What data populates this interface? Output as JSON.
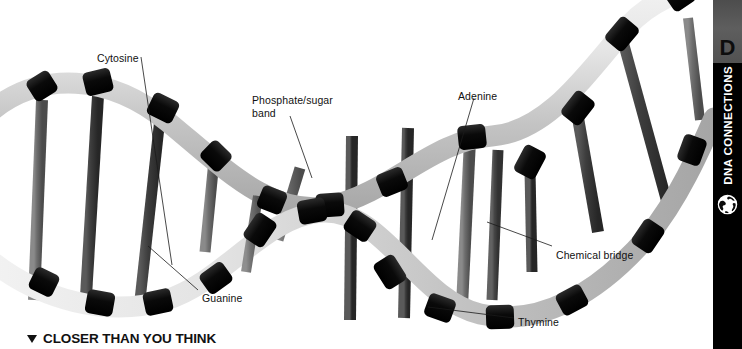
{
  "figure": {
    "alt_name": "dna-double-helix-model",
    "labels": [
      {
        "id": "cytosine",
        "text": "Cytosine",
        "x": 97,
        "y": 52
      },
      {
        "id": "phosphate-sugar",
        "text": "Phosphate/sugar\nband",
        "x": 252,
        "y": 94
      },
      {
        "id": "adenine",
        "text": "Adenine",
        "x": 458,
        "y": 90
      },
      {
        "id": "guanine",
        "text": "Guanine",
        "x": 202,
        "y": 292
      },
      {
        "id": "chemical-bridge",
        "text": "Chemical bridge",
        "x": 556,
        "y": 249
      },
      {
        "id": "thymine",
        "text": "Thymine",
        "x": 518,
        "y": 316
      }
    ]
  },
  "caption": {
    "marker": "triangle-down",
    "text": "CLOSER THAN YOU THINK"
  },
  "sidebar": {
    "letter": "D",
    "title": "DNA CONNECTIONS",
    "icon": "globe-icon",
    "colors": {
      "background": "#000000",
      "top_block": "#595959",
      "letter": "#0d0d0d",
      "text": "#ffffff"
    }
  },
  "colors": {
    "page_background": "#ffffff",
    "backbone_light": "#d9d9d9",
    "backbone_mid": "#bfbfbf",
    "band_black": "#0f0f0f",
    "rung_dark": "#6b6b6b",
    "rung_darker": "#4a4a4a",
    "leader_line": "#1a1a1a",
    "text": "#111111"
  }
}
